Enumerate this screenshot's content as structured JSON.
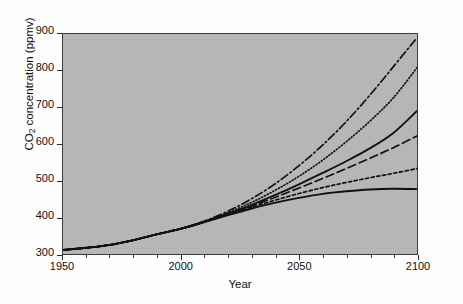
{
  "figure": {
    "background_color": "#fdfdfd",
    "plot_background_color": "#b6b6b6",
    "frame_color": "#3a3a3a",
    "line_color": "#111111"
  },
  "axes": {
    "y_title_prefix": "CO",
    "y_title_sub": "2",
    "y_title_suffix": " concentration (ppmv)",
    "x_title": "Year",
    "y_ticks": [
      300,
      400,
      500,
      600,
      700,
      800,
      900
    ],
    "x_ticks": [
      1950,
      2000,
      2050,
      2100
    ],
    "x_minor_step": 10,
    "xlim": [
      1950,
      2100
    ],
    "ylim": [
      300,
      900
    ]
  },
  "chart_data": {
    "type": "line",
    "title": "",
    "xlabel": "Year",
    "ylabel": "CO2 concentration (ppmv)",
    "xlim": [
      1950,
      2100
    ],
    "ylim": [
      300,
      900
    ],
    "xticks": [
      1950,
      2000,
      2050,
      2100
    ],
    "yticks": [
      300,
      400,
      500,
      600,
      700,
      800,
      900
    ],
    "grid": false,
    "legend": "none",
    "x": [
      1950,
      1960,
      1970,
      1980,
      1990,
      2000,
      2010,
      2020,
      2030,
      2040,
      2050,
      2060,
      2070,
      2080,
      2090,
      2100
    ],
    "series": [
      {
        "name": "Scenario A1FI (dash-dot)",
        "style": "dashdot",
        "values": [
          311,
          317,
          325,
          338,
          354,
          369,
          390,
          417,
          451,
          492,
          541,
          597,
          661,
          733,
          811,
          890
        ]
      },
      {
        "name": "Scenario A2 (dotted)",
        "style": "dotted",
        "values": [
          311,
          317,
          325,
          338,
          354,
          369,
          389,
          413,
          441,
          474,
          512,
          556,
          606,
          662,
          726,
          808
        ]
      },
      {
        "name": "Scenario A1B (solid-upper)",
        "style": "solid",
        "values": [
          311,
          317,
          325,
          338,
          354,
          369,
          388,
          410,
          434,
          461,
          490,
          521,
          553,
          588,
          630,
          690
        ]
      },
      {
        "name": "Scenario B2 (long-dash)",
        "style": "longdash",
        "values": [
          311,
          317,
          325,
          338,
          354,
          369,
          388,
          409,
          431,
          455,
          480,
          506,
          533,
          561,
          590,
          622
        ]
      },
      {
        "name": "Scenario A1T (short-dash)",
        "style": "shortdash",
        "values": [
          311,
          317,
          325,
          338,
          354,
          369,
          388,
          408,
          428,
          447,
          465,
          481,
          495,
          508,
          520,
          533
        ]
      },
      {
        "name": "Scenario B1 (solid-lower)",
        "style": "solid",
        "values": [
          311,
          317,
          325,
          338,
          354,
          369,
          387,
          406,
          424,
          440,
          453,
          464,
          471,
          476,
          478,
          477
        ]
      }
    ]
  }
}
